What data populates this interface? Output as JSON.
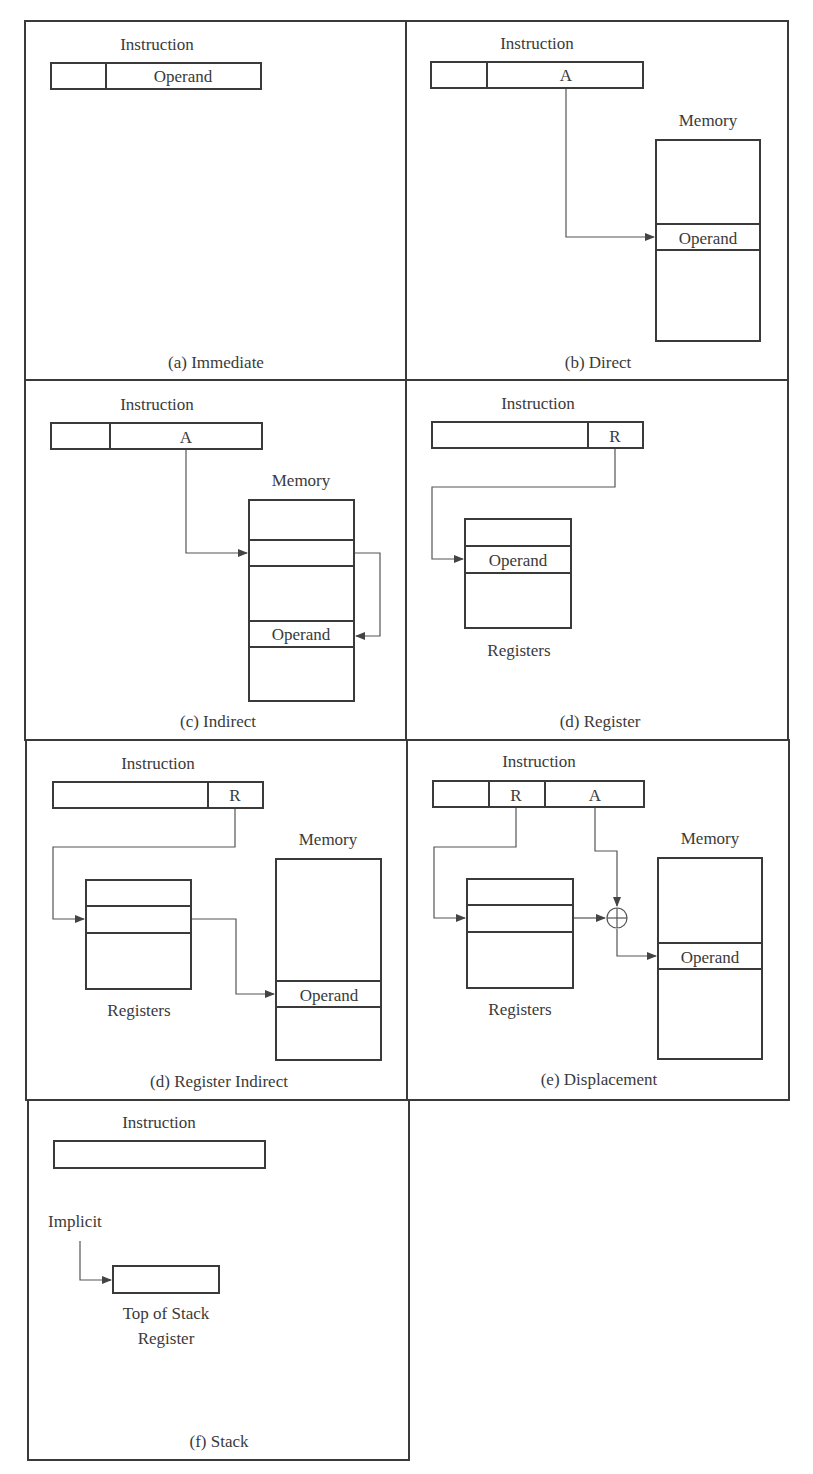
{
  "figure": {
    "panels": {
      "a": {
        "title": "Instruction",
        "caption": "(a) Immediate",
        "field": "Operand"
      },
      "b": {
        "title": "Instruction",
        "caption": "(b) Direct",
        "field": "A",
        "memory": "Memory",
        "operand": "Operand"
      },
      "c": {
        "title": "Instruction",
        "caption": "(c) Indirect",
        "field": "A",
        "memory": "Memory",
        "operand": "Operand"
      },
      "d": {
        "title": "Instruction",
        "caption": "(d) Register",
        "field": "R",
        "operand": "Operand",
        "registers": "Registers"
      },
      "e": {
        "title": "Instruction",
        "caption": "(d) Register Indirect",
        "field": "R",
        "memory": "Memory",
        "operand": "Operand",
        "registers": "Registers"
      },
      "f": {
        "title": "Instruction",
        "caption": "(e) Displacement",
        "field_r": "R",
        "field_a": "A",
        "memory": "Memory",
        "operand": "Operand",
        "registers": "Registers"
      },
      "g": {
        "title": "Instruction",
        "caption": "(f) Stack",
        "implicit": "Implicit",
        "tos_line1": "Top of Stack",
        "tos_line2": "Register"
      }
    },
    "adder_symbol": "⊕"
  }
}
